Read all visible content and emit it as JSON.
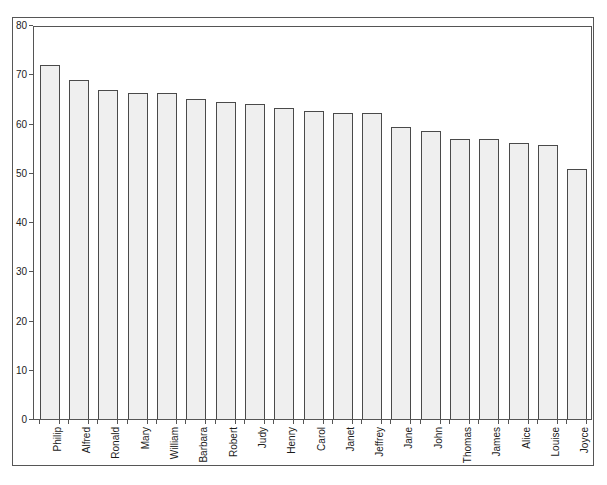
{
  "chart_data": {
    "type": "bar",
    "title": "",
    "subtitle": "",
    "xlabel": "",
    "ylabel": "",
    "ylim": [
      0,
      80
    ],
    "y_ticks": [
      0,
      10,
      20,
      30,
      40,
      50,
      60,
      70,
      80
    ],
    "grid": false,
    "legend": null,
    "orientation": "vertical",
    "bar_fill_color": "#efefef",
    "bar_border_color": "#4a4a4a",
    "axis_color": "#555555",
    "background_color": "#ffffff",
    "x_tick_label_rotation": -90,
    "categories": [
      "Philip",
      "Alfred",
      "Ronald",
      "Mary",
      "William",
      "Barbara",
      "Robert",
      "Judy",
      "Henry",
      "Carol",
      "Janet",
      "Jeffrey",
      "Jane",
      "John",
      "Thomas",
      "James",
      "Alice",
      "Louise",
      "Joyce"
    ],
    "values": [
      72.0,
      69.0,
      67.0,
      66.4,
      66.4,
      65.2,
      64.6,
      64.2,
      63.4,
      62.7,
      62.4,
      62.4,
      59.5,
      58.7,
      57.1,
      57.0,
      56.3,
      55.9,
      51.0
    ]
  }
}
